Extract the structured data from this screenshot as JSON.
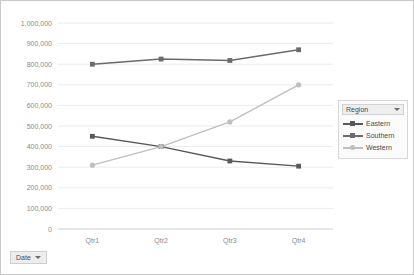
{
  "chart_data": {
    "type": "line",
    "title": "",
    "xlabel": "",
    "ylabel": "",
    "categories": [
      "Qtr1",
      "Qtr2",
      "Qtr3",
      "Qtr4"
    ],
    "ylim": [
      0,
      1000000
    ],
    "ytick_step": 100000,
    "grid": true,
    "legend_position": "right",
    "ytick_labels": [
      "1,000,000",
      "900,000",
      "800,000",
      "700,000",
      "600,000",
      "500,000",
      "400,000",
      "300,000",
      "200,000",
      "100,000",
      "0"
    ],
    "ytick_values": [
      1000000,
      900000,
      800000,
      700000,
      600000,
      500000,
      400000,
      300000,
      200000,
      100000,
      0
    ],
    "series": [
      {
        "name": "Eastern",
        "color": "#595959",
        "marker": "square",
        "values": [
          450000,
          400000,
          330000,
          305000
        ]
      },
      {
        "name": "Southern",
        "color": "#6b6b6b",
        "marker": "square",
        "values": [
          800000,
          825000,
          818000,
          870000
        ]
      },
      {
        "name": "Western",
        "color": "#bfbfbf",
        "marker": "circle",
        "values": [
          310000,
          400000,
          520000,
          700000
        ]
      }
    ]
  },
  "legend": {
    "title": "Region",
    "dropdown_icon": "chevron-down-icon"
  },
  "date_filter": {
    "label": "Date",
    "dropdown_icon": "chevron-down-icon"
  },
  "colors": {
    "border": "#c9c9c9",
    "grid": "#ececec",
    "axis_text": "#8a8a8a",
    "legend_bg": "#fbfbfb",
    "button_bg": "#eeeeee"
  }
}
